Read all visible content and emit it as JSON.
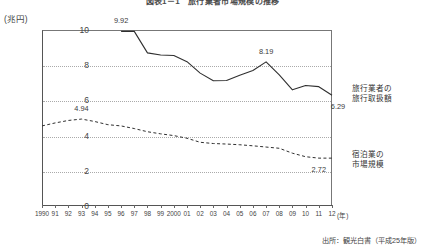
{
  "figure": {
    "title": "図表1－1　旅行業者市場規模の推移",
    "source": "出所：観光白書（平成25年版）",
    "unit_label": "(兆円)",
    "xaxis_unit": "(年)"
  },
  "legend": {
    "series1_line1": "旅行業者の",
    "series1_line2": "旅行取扱額",
    "series2_line1": "宿泊業の",
    "series2_line2": "市場規模"
  },
  "chart_data": {
    "type": "line",
    "title": "図表1－1　旅行業者市場規模の推移",
    "xlabel": "(年)",
    "ylabel": "(兆円)",
    "ylim": [
      0,
      10
    ],
    "yticks": [
      "0",
      "2",
      "4",
      "6",
      "8",
      "10"
    ],
    "grid": true,
    "legend_position": "right",
    "categories": [
      "1990",
      "91",
      "92",
      "93",
      "94",
      "95",
      "96",
      "97",
      "98",
      "99",
      "2000",
      "01",
      "02",
      "03",
      "04",
      "05",
      "06",
      "07",
      "08",
      "09",
      "10",
      "11",
      "12"
    ],
    "series": [
      {
        "name": "旅行業者の旅行取扱額",
        "style": "solid",
        "values": [
          null,
          null,
          null,
          null,
          null,
          null,
          9.92,
          9.92,
          8.7,
          8.58,
          8.55,
          8.2,
          7.55,
          7.12,
          7.13,
          7.43,
          7.7,
          8.19,
          7.45,
          6.6,
          6.85,
          6.78,
          6.29
        ]
      },
      {
        "name": "宿泊業の市場規模",
        "style": "dashed",
        "values": [
          4.55,
          4.72,
          4.86,
          4.94,
          4.8,
          4.62,
          4.55,
          4.4,
          4.22,
          4.1,
          4.0,
          3.85,
          3.62,
          3.55,
          3.52,
          3.48,
          3.42,
          3.35,
          3.28,
          3.0,
          2.8,
          2.72,
          2.72
        ]
      }
    ],
    "annotations": [
      {
        "text": "9.92",
        "x": "96",
        "y": 9.92
      },
      {
        "text": "4.94",
        "x": "93",
        "y": 4.94
      },
      {
        "text": "8.19",
        "x": "07",
        "y": 8.19
      },
      {
        "text": "6.29",
        "x": "12",
        "y": 6.29
      },
      {
        "text": "2.72",
        "x": "11",
        "y": 2.72
      }
    ]
  }
}
